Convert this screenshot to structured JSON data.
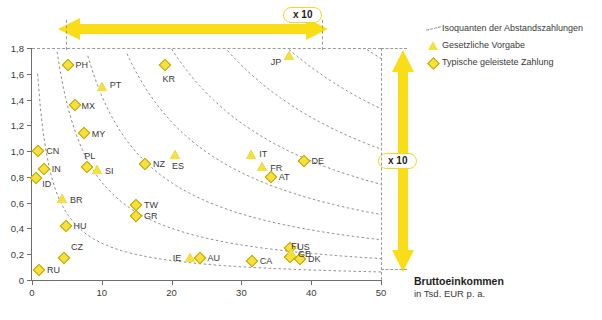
{
  "chart_data": {
    "type": "scatter",
    "title": "",
    "xlabel": "Bruttoeinkommen",
    "xlabel_sub": "in Tsd. EUR p. a.",
    "ylabel": "",
    "xlim": [
      0,
      50
    ],
    "ylim": [
      0,
      1.8
    ],
    "xticks": [
      0,
      10,
      20,
      30,
      40,
      50
    ],
    "xtick_labels": [
      "0",
      "10",
      "20",
      "30",
      "40",
      "50"
    ],
    "yticks": [
      0,
      0.2,
      0.4,
      0.6,
      0.8,
      1.0,
      1.2,
      1.4,
      1.6,
      1.8
    ],
    "ytick_labels": [
      "0",
      "0,2",
      "0,4",
      "0,6",
      "0,8",
      "1,0",
      "1,2",
      "1,4",
      "1,6",
      "1,8"
    ],
    "grid": false,
    "legend_position": "top-right",
    "legend": [
      {
        "id": "isoquant-entry",
        "marker": "dashed-line",
        "label": "Isoquanten der Abstandszahlungen"
      },
      {
        "id": "statutory-entry",
        "marker": "triangle",
        "label": "Gesetzliche Vorgabe"
      },
      {
        "id": "typical-entry",
        "marker": "diamond",
        "label": "Typische geleistete Zahlung"
      }
    ],
    "series": [
      {
        "name": "Typische geleistete Zahlung",
        "marker": "diamond",
        "color": "#f5e03c",
        "points": [
          {
            "code": "PH",
            "x": 5.1,
            "y": 1.67,
            "lx": 8,
            "ly": 0
          },
          {
            "code": "KR",
            "x": 19.0,
            "y": 1.67,
            "lx": -2,
            "ly": 14
          },
          {
            "code": "MX",
            "x": 6.1,
            "y": 1.36,
            "lx": 7,
            "ly": 1
          },
          {
            "code": "MY",
            "x": 7.4,
            "y": 1.14,
            "lx": 8,
            "ly": 1
          },
          {
            "code": "CN",
            "x": 0.9,
            "y": 1.0,
            "lx": 8,
            "ly": 0
          },
          {
            "code": "NZ",
            "x": 16.2,
            "y": 0.9,
            "lx": 8,
            "ly": 0
          },
          {
            "code": "DE",
            "x": 38.9,
            "y": 0.92,
            "lx": 8,
            "ly": 0
          },
          {
            "code": "PL",
            "x": 7.9,
            "y": 0.88,
            "lx": -3,
            "ly": -11
          },
          {
            "code": "IN",
            "x": 1.7,
            "y": 0.86,
            "lx": 8,
            "ly": 0
          },
          {
            "code": "ID",
            "x": 0.6,
            "y": 0.79,
            "lx": 6,
            "ly": 6
          },
          {
            "code": "AT",
            "x": 34.2,
            "y": 0.8,
            "lx": 8,
            "ly": 0
          },
          {
            "code": "TW",
            "x": 14.9,
            "y": 0.58,
            "lx": 8,
            "ly": 0
          },
          {
            "code": "GR",
            "x": 14.9,
            "y": 0.5,
            "lx": 8,
            "ly": 0
          },
          {
            "code": "HU",
            "x": 4.8,
            "y": 0.42,
            "lx": 8,
            "ly": 0
          },
          {
            "code": "US",
            "x": 37.0,
            "y": 0.25,
            "lx": 7,
            "ly": -1
          },
          {
            "code": "AU",
            "x": 24.0,
            "y": 0.17,
            "lx": 8,
            "ly": 0
          },
          {
            "code": "CZ",
            "x": 4.6,
            "y": 0.17,
            "lx": 7,
            "ly": -11
          },
          {
            "code": "CA",
            "x": 31.5,
            "y": 0.15,
            "lx": 8,
            "ly": 0
          },
          {
            "code": "FI",
            "x": 37.0,
            "y": 0.18,
            "lx": 1,
            "ly": -11
          },
          {
            "code": "DK",
            "x": 38.4,
            "y": 0.16,
            "lx": 8,
            "ly": 0
          },
          {
            "code": "RU",
            "x": 1.0,
            "y": 0.08,
            "lx": 8,
            "ly": 0
          }
        ]
      },
      {
        "name": "Gesetzliche Vorgabe",
        "marker": "triangle",
        "color": "#f5e03c",
        "points": [
          {
            "code": "JP",
            "x": 36.8,
            "y": 1.74,
            "lx": -18,
            "ly": 6
          },
          {
            "code": "PT",
            "x": 10.0,
            "y": 1.5,
            "lx": 8,
            "ly": -2
          },
          {
            "code": "IT",
            "x": 31.4,
            "y": 0.97,
            "lx": 8,
            "ly": -1
          },
          {
            "code": "ES",
            "x": 20.5,
            "y": 0.97,
            "lx": -3,
            "ly": 11
          },
          {
            "code": "FR",
            "x": 33.0,
            "y": 0.88,
            "lx": 8,
            "ly": 1
          },
          {
            "code": "SI",
            "x": 9.3,
            "y": 0.85,
            "lx": 8,
            "ly": 1
          },
          {
            "code": "BR",
            "x": 4.3,
            "y": 0.63,
            "lx": 8,
            "ly": 1
          },
          {
            "code": "IE",
            "x": 22.6,
            "y": 0.17,
            "lx": -17,
            "ly": 0
          },
          {
            "code": "GB",
            "x": 37.1,
            "y": 0.21,
            "lx": 7,
            "ly": 1
          }
        ]
      }
    ],
    "annotations": [
      {
        "id": "horizontal-scale-arrow",
        "label": "x 10",
        "orientation": "horizontal",
        "description": "Factor 10 span across income axis"
      },
      {
        "id": "vertical-scale-arrow",
        "label": "x 10",
        "orientation": "vertical",
        "description": "Factor 10 span across payment axis"
      }
    ],
    "curves_description": "Isoquanten der Abstandszahlungen (dashed hyperbolic iso-curves)"
  },
  "axis_title": {
    "line1": "Bruttoeinkommen",
    "line2": "in Tsd. EUR p. a."
  }
}
